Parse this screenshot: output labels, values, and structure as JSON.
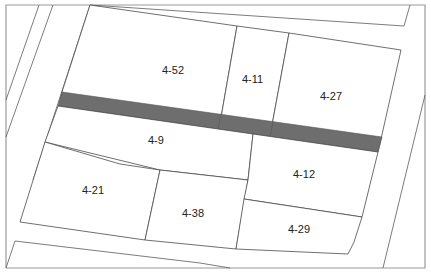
{
  "map": {
    "type": "cadastral-parcel-map",
    "colors": {
      "background": "#ffffff",
      "parcel_line": "#4a4a4a",
      "frame": "#9a9a9a",
      "highlight_strip": "#6e6e6e",
      "label": "#222222"
    },
    "parcels": [
      {
        "id": "4-52",
        "label": "4-52"
      },
      {
        "id": "4-11",
        "label": "4-11"
      },
      {
        "id": "4-27",
        "label": "4-27"
      },
      {
        "id": "4-9",
        "label": "4-9"
      },
      {
        "id": "4-21",
        "label": "4-21"
      },
      {
        "id": "4-38",
        "label": "4-38"
      },
      {
        "id": "4-12",
        "label": "4-12"
      },
      {
        "id": "4-29",
        "label": "4-29"
      }
    ],
    "highlighted_strip": {
      "label": ""
    }
  }
}
